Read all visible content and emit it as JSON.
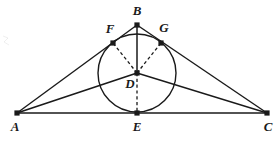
{
  "figure": {
    "background_color": "#ffffff",
    "stroke_color": "#1a1a1a",
    "label_color": "#1a1a1a",
    "canvas": {
      "width": 278,
      "height": 145
    }
  },
  "points": {
    "A": {
      "label": "A",
      "x": 17,
      "y": 113,
      "label_x": 15,
      "label_y": 131,
      "marker": true
    },
    "B": {
      "label": "B",
      "x": 137,
      "y": 25,
      "label_x": 137,
      "label_y": 15,
      "marker": true
    },
    "C": {
      "label": "C",
      "x": 267,
      "y": 113,
      "label_x": 268,
      "label_y": 131,
      "marker": true
    },
    "D": {
      "label": "D",
      "x": 137,
      "y": 73,
      "label_x": 130,
      "label_y": 88,
      "marker": true
    },
    "E": {
      "label": "E",
      "x": 137,
      "y": 113,
      "label_x": 137,
      "label_y": 131,
      "marker": true
    },
    "F": {
      "label": "F",
      "x": 113,
      "y": 43,
      "label_x": 110,
      "label_y": 33,
      "marker": true
    },
    "G": {
      "label": "G",
      "x": 161,
      "y": 43,
      "label_x": 164,
      "label_y": 32,
      "marker": true
    }
  },
  "circle": {
    "name": "inscribed-circle",
    "center_x": 137,
    "center_y": 73,
    "radius": 39
  },
  "solid_segments": [
    {
      "name": "side-AB",
      "from": "A",
      "to": "B"
    },
    {
      "name": "side-BC",
      "from": "B",
      "to": "C"
    },
    {
      "name": "side-AC",
      "from": "A",
      "to": "C"
    },
    {
      "name": "cevian-AD",
      "from": "A",
      "to": "D"
    },
    {
      "name": "cevian-CD",
      "from": "C",
      "to": "D"
    },
    {
      "name": "cevian-BD",
      "from": "B",
      "to": "D"
    }
  ],
  "dashed_segments": [
    {
      "name": "radius-DF",
      "from": "D",
      "to": "F"
    },
    {
      "name": "radius-DG",
      "from": "D",
      "to": "G"
    },
    {
      "name": "radius-DE",
      "from": "D",
      "to": "E"
    }
  ],
  "labels_order": [
    "B",
    "F",
    "G",
    "D",
    "A",
    "E",
    "C"
  ]
}
